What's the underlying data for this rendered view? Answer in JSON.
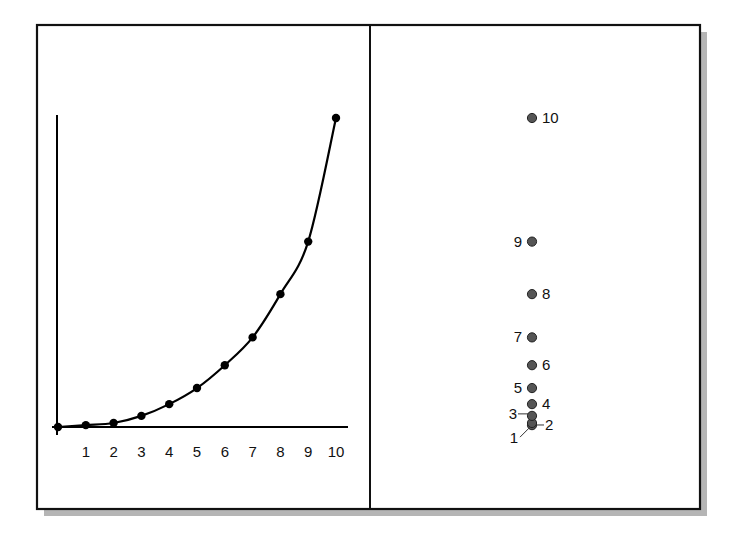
{
  "chart_data": [
    {
      "type": "line",
      "panel": "left",
      "title": "",
      "xlabel": "",
      "ylabel": "",
      "x": [
        0,
        1,
        2,
        3,
        4,
        5,
        6,
        7,
        8,
        9,
        10
      ],
      "series": [
        {
          "name": "curve",
          "values": [
            0,
            0.6,
            1.3,
            3.6,
            7.4,
            12.6,
            20,
            29,
            43,
            60,
            100
          ]
        }
      ],
      "x_tick_labels": [
        "1",
        "2",
        "3",
        "4",
        "5",
        "6",
        "7",
        "8",
        "9",
        "10"
      ],
      "xlim": [
        0,
        10
      ],
      "ylim": [
        0,
        100
      ],
      "grid": false,
      "markers": true,
      "y_tick_labels": []
    },
    {
      "type": "scatter",
      "panel": "right",
      "title": "",
      "description": "Points projected onto a single vertical axis, labeled by index",
      "labels": [
        "1",
        "2",
        "3",
        "4",
        "5",
        "6",
        "7",
        "8",
        "9",
        "10"
      ],
      "values": [
        0.6,
        1.3,
        3.6,
        7.4,
        12.6,
        20,
        29,
        43,
        60,
        100
      ],
      "label_side": [
        "left-leader",
        "right-leader",
        "left-leader",
        "right",
        "left",
        "right",
        "left",
        "right",
        "left",
        "right"
      ],
      "ylim": [
        0,
        100
      ]
    }
  ],
  "left_panel": {
    "tick_labels": [
      "1",
      "2",
      "3",
      "4",
      "5",
      "6",
      "7",
      "8",
      "9",
      "10"
    ]
  },
  "right_panel": {
    "point_labels": [
      "1",
      "2",
      "3",
      "4",
      "5",
      "6",
      "7",
      "8",
      "9",
      "10"
    ]
  },
  "colors": {
    "frame": "#111111",
    "curve": "#000000",
    "left_marker": "#000000",
    "right_marker": "#555555",
    "shadow": "#b5b5b5"
  }
}
